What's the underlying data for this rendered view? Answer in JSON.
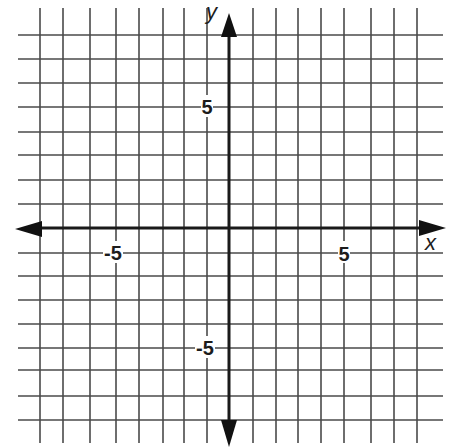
{
  "chart_data": {
    "type": "coordinate-grid",
    "title": "",
    "xlabel": "x",
    "ylabel": "y",
    "xlim": [
      -9,
      9
    ],
    "ylim": [
      -9,
      9
    ],
    "grid": true,
    "grid_step": 1,
    "axes_arrows": true,
    "x_tick_labels": [
      {
        "value": -5,
        "label": "-5"
      },
      {
        "value": 5,
        "label": "5"
      }
    ],
    "y_tick_labels": [
      {
        "value": 5,
        "label": "5"
      },
      {
        "value": -5,
        "label": "-5"
      }
    ],
    "series": []
  },
  "layout": {
    "origin_px": [
      229,
      228
    ],
    "unit_px": 23.4,
    "x_gridlines_px": [
      40,
      63,
      90,
      116,
      139,
      163,
      184,
      207,
      253,
      276,
      298,
      321,
      344,
      371,
      394,
      417
    ],
    "y_gridlines_px": [
      35,
      59,
      83,
      107,
      132,
      155,
      180,
      204,
      253,
      276,
      300,
      324,
      348,
      370,
      396,
      420
    ],
    "v_line_span": [
      8,
      443
    ],
    "h_line_span": [
      18,
      443
    ]
  },
  "labels": {
    "x_axis": "x",
    "y_axis": "y",
    "x_neg5": "-5",
    "x_pos5": "5",
    "y_pos5": "5",
    "y_neg5": "-5"
  }
}
